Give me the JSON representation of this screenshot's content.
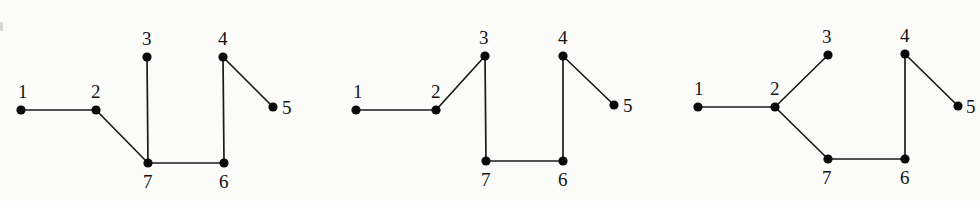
{
  "figure": {
    "title": "",
    "background_color": "#fbfbf9",
    "node_color": "#0a0a0a",
    "edge_color": "#1b1b1b",
    "label_color": "#141414",
    "node_radius": 4.6,
    "edge_width": 1.7,
    "label_font_size": 19
  },
  "graphs": [
    {
      "name": "graph-1",
      "nodes": [
        {
          "id": "1",
          "label": "1",
          "x": 21,
          "y": 110,
          "label_x": 18,
          "label_y": 98
        },
        {
          "id": "2",
          "label": "2",
          "x": 96,
          "y": 110,
          "label_x": 91,
          "label_y": 98
        },
        {
          "id": "3",
          "label": "3",
          "x": 147,
          "y": 57,
          "label_x": 142,
          "label_y": 45
        },
        {
          "id": "4",
          "label": "4",
          "x": 223,
          "y": 57,
          "label_x": 218,
          "label_y": 45
        },
        {
          "id": "5",
          "label": "5",
          "x": 273,
          "y": 107,
          "label_x": 282,
          "label_y": 114
        },
        {
          "id": "6",
          "label": "6",
          "x": 224,
          "y": 163,
          "label_x": 219,
          "label_y": 188
        },
        {
          "id": "7",
          "label": "7",
          "x": 148,
          "y": 163,
          "label_x": 143,
          "label_y": 188
        }
      ],
      "edges": [
        {
          "from": "1",
          "to": "2"
        },
        {
          "from": "2",
          "to": "7"
        },
        {
          "from": "3",
          "to": "7"
        },
        {
          "from": "7",
          "to": "6"
        },
        {
          "from": "6",
          "to": "4"
        },
        {
          "from": "4",
          "to": "5"
        }
      ]
    },
    {
      "name": "graph-2",
      "nodes": [
        {
          "id": "1",
          "label": "1",
          "x": 356,
          "y": 110,
          "label_x": 353,
          "label_y": 98
        },
        {
          "id": "2",
          "label": "2",
          "x": 436,
          "y": 110,
          "label_x": 431,
          "label_y": 98
        },
        {
          "id": "3",
          "label": "3",
          "x": 485,
          "y": 56,
          "label_x": 479,
          "label_y": 44
        },
        {
          "id": "4",
          "label": "4",
          "x": 563,
          "y": 56,
          "label_x": 558,
          "label_y": 44
        },
        {
          "id": "5",
          "label": "5",
          "x": 614,
          "y": 105,
          "label_x": 623,
          "label_y": 112
        },
        {
          "id": "6",
          "label": "6",
          "x": 563,
          "y": 161,
          "label_x": 558,
          "label_y": 186
        },
        {
          "id": "7",
          "label": "7",
          "x": 486,
          "y": 161,
          "label_x": 481,
          "label_y": 186
        }
      ],
      "edges": [
        {
          "from": "1",
          "to": "2"
        },
        {
          "from": "2",
          "to": "3"
        },
        {
          "from": "3",
          "to": "7"
        },
        {
          "from": "7",
          "to": "6"
        },
        {
          "from": "6",
          "to": "4"
        },
        {
          "from": "4",
          "to": "5"
        }
      ]
    },
    {
      "name": "graph-3",
      "nodes": [
        {
          "id": "1",
          "label": "1",
          "x": 698,
          "y": 107,
          "label_x": 694,
          "label_y": 95
        },
        {
          "id": "2",
          "label": "2",
          "x": 775,
          "y": 107,
          "label_x": 770,
          "label_y": 95
        },
        {
          "id": "3",
          "label": "3",
          "x": 828,
          "y": 55,
          "label_x": 822,
          "label_y": 43
        },
        {
          "id": "4",
          "label": "4",
          "x": 905,
          "y": 54,
          "label_x": 900,
          "label_y": 42
        },
        {
          "id": "5",
          "label": "5",
          "x": 958,
          "y": 106,
          "label_x": 966,
          "label_y": 113
        },
        {
          "id": "6",
          "label": "6",
          "x": 905,
          "y": 159,
          "label_x": 900,
          "label_y": 184
        },
        {
          "id": "7",
          "label": "7",
          "x": 828,
          "y": 159,
          "label_x": 822,
          "label_y": 184
        }
      ],
      "edges": [
        {
          "from": "1",
          "to": "2"
        },
        {
          "from": "2",
          "to": "3"
        },
        {
          "from": "2",
          "to": "7"
        },
        {
          "from": "7",
          "to": "6"
        },
        {
          "from": "6",
          "to": "4"
        },
        {
          "from": "4",
          "to": "5"
        }
      ]
    }
  ],
  "artifacts": [
    {
      "name": "scan-speck-left-margin",
      "x": 0,
      "y": 22,
      "width": 3,
      "height": 9
    }
  ]
}
